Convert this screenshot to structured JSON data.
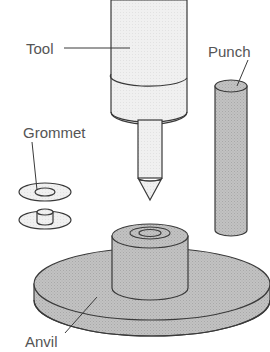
{
  "diagram": {
    "labels": {
      "tool": "Tool",
      "punch": "Punch",
      "grommet": "Grommet",
      "anvil": "Anvil"
    },
    "colors": {
      "outline": "#3a3a3a",
      "tool_body": "#f1f1f1",
      "metal_gray": "#bdbdbd",
      "metal_gray_dark": "#a9a9a9",
      "grommet_fill": "#eeeeee",
      "label_text": "#555555",
      "background": "#ffffff"
    }
  }
}
